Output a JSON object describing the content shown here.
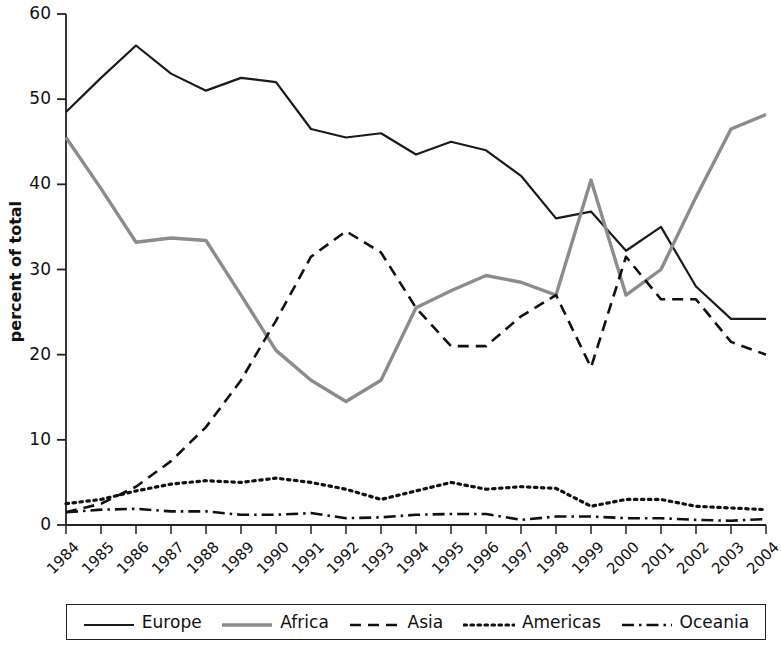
{
  "chart_data": {
    "type": "line",
    "title": "",
    "xlabel": "",
    "ylabel": "percent of total",
    "x": [
      1984,
      1985,
      1986,
      1987,
      1988,
      1989,
      1990,
      1991,
      1992,
      1993,
      1994,
      1995,
      1996,
      1997,
      1998,
      1999,
      2000,
      2001,
      2002,
      2003,
      2004
    ],
    "categories": [
      "1984",
      "1985",
      "1986",
      "1987",
      "1988",
      "1989",
      "1990",
      "1991",
      "1992",
      "1993",
      "1994",
      "1995",
      "1996",
      "1997",
      "1998",
      "1999",
      "2000",
      "2001",
      "2002",
      "2003",
      "2004"
    ],
    "xlim": [
      1984,
      2004
    ],
    "ylim": [
      0,
      60
    ],
    "yticks": [
      0,
      10,
      20,
      30,
      40,
      50,
      60
    ],
    "ytick_labels": [
      "0",
      "10",
      "20",
      "30",
      "40",
      "50",
      "60"
    ],
    "grid": false,
    "legend_position": "bottom",
    "series": [
      {
        "name": "Europe",
        "color": "#1a1a1a",
        "style": "solid",
        "values": [
          48.5,
          52.5,
          56.3,
          53.0,
          51.0,
          52.5,
          52.0,
          46.5,
          45.5,
          46.0,
          43.5,
          45.0,
          44.0,
          41.0,
          36.0,
          36.8,
          32.2,
          35.0,
          28.0,
          24.2,
          24.2
        ]
      },
      {
        "name": "Africa",
        "color": "#8c8c8c",
        "style": "solid",
        "values": [
          45.5,
          39.5,
          33.2,
          33.7,
          33.4,
          27.0,
          20.5,
          17.0,
          14.5,
          17.0,
          25.5,
          27.5,
          29.3,
          28.5,
          27.0,
          40.5,
          27.0,
          30.0,
          38.5,
          46.5,
          48.2
        ]
      },
      {
        "name": "Asia",
        "color": "#111111",
        "style": "dashed",
        "values": [
          1.5,
          2.5,
          4.5,
          7.5,
          11.5,
          17.0,
          24.0,
          31.5,
          34.5,
          32.0,
          25.5,
          21.0,
          21.0,
          24.5,
          27.0,
          18.5,
          31.5,
          26.5,
          26.5,
          21.5,
          20.0
        ]
      },
      {
        "name": "Americas",
        "color": "#111111",
        "style": "dotted",
        "values": [
          2.5,
          3.0,
          4.0,
          4.8,
          5.2,
          5.0,
          5.5,
          5.0,
          4.2,
          3.0,
          4.0,
          5.0,
          4.2,
          4.5,
          4.3,
          2.2,
          3.0,
          3.0,
          2.2,
          2.0,
          1.8
        ]
      },
      {
        "name": "Oceania",
        "color": "#111111",
        "style": "dashdot",
        "values": [
          1.5,
          1.8,
          1.9,
          1.6,
          1.6,
          1.2,
          1.2,
          1.4,
          0.8,
          0.9,
          1.2,
          1.3,
          1.3,
          0.6,
          1.0,
          1.0,
          0.8,
          0.8,
          0.6,
          0.5,
          0.7
        ]
      }
    ]
  },
  "legend": {
    "items": [
      {
        "label": "Europe"
      },
      {
        "label": "Africa"
      },
      {
        "label": "Asia"
      },
      {
        "label": "Americas"
      },
      {
        "label": "Oceania"
      }
    ]
  }
}
